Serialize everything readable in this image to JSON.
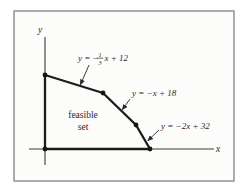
{
  "colors": {
    "frame_border": "#8a8a8a",
    "paper": "#fcfcfa",
    "boundary_line": "#1b1b1b",
    "axis_line": "#3a3a3a",
    "text": "#2a2a2a"
  },
  "diagram": {
    "x_axis_label": "x",
    "y_axis_label": "y",
    "region_label_line1": "feasible",
    "region_label_line2": "set",
    "equations": [
      {
        "prefix": "y = −",
        "numerator": "1",
        "denominator": "3",
        "suffix": "x + 12"
      },
      {
        "text": "y = −x + 18"
      },
      {
        "text": "y = −2x + 32"
      }
    ]
  }
}
